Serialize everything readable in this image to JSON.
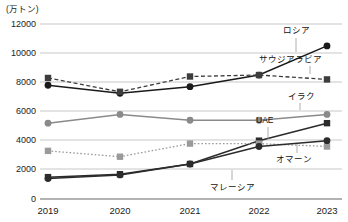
{
  "chart_data": {
    "type": "line",
    "title": "",
    "subtitle": "",
    "xlabel": "",
    "ylabel": "(万トン)",
    "unit_label": "(万トン)",
    "categories": [
      "2019",
      "2020",
      "2021",
      "2022",
      "2023"
    ],
    "x_tick_labels": [
      "2019",
      "2020",
      "2021",
      "2022",
      "2023"
    ],
    "y_tick_labels": [
      "0",
      "2000",
      "4000",
      "6000",
      "8000",
      "10000",
      "12000"
    ],
    "y_ticks": [
      0,
      2000,
      4000,
      6000,
      8000,
      10000,
      12000
    ],
    "ylim": [
      0,
      12000
    ],
    "grid": true,
    "grid_axis": "y",
    "legend": "inline-labels-right",
    "series": [
      {
        "name": "ロシア",
        "label": "ロシア",
        "marker": "circle",
        "line_style": "solid",
        "color": "#1a1a1a",
        "values": [
          7800,
          7250,
          7700,
          8500,
          10500
        ]
      },
      {
        "name": "サウジアラビア",
        "label": "サウジアラビア",
        "marker": "square",
        "line_style": "dashed",
        "color": "#3d3d3d",
        "values": [
          8300,
          7350,
          8400,
          8500,
          8200
        ]
      },
      {
        "name": "イラク",
        "label": "イラク",
        "marker": "circle",
        "line_style": "solid",
        "color": "#8a8a8a",
        "values": [
          5200,
          5800,
          5400,
          5400,
          5800
        ]
      },
      {
        "name": "UAE",
        "label": "UAE",
        "marker": "square",
        "line_style": "solid",
        "color": "#2b2b2b",
        "values": [
          1500,
          1700,
          2400,
          4000,
          5200
        ]
      },
      {
        "name": "オマーン",
        "label": "オマーン",
        "marker": "square",
        "line_style": "dotted",
        "color": "#9a9a9a",
        "values": [
          3300,
          2900,
          3800,
          3800,
          3600
        ]
      },
      {
        "name": "マレーシア",
        "label": "マレーシア",
        "marker": "circle",
        "line_style": "solid",
        "color": "#2b2b2b",
        "values": [
          1400,
          1650,
          2400,
          3600,
          4000
        ]
      }
    ],
    "annotations": [
      {
        "text": "ロシア",
        "points_to_series": "ロシア"
      },
      {
        "text": "サウジアラビア",
        "points_to_series": "サウジアラビア"
      },
      {
        "text": "イラク",
        "points_to_series": "イラク"
      },
      {
        "text": "UAE",
        "points_to_series": "UAE"
      },
      {
        "text": "オマーン",
        "points_to_series": "オマーン"
      },
      {
        "text": "マレーシア",
        "points_to_series": "マレーシア"
      }
    ]
  },
  "labels": {
    "unit": "(万トン)",
    "y0": "0",
    "y2000": "2000",
    "y4000": "4000",
    "y6000": "6000",
    "y8000": "8000",
    "y10000": "10000",
    "y12000": "12000",
    "x2019": "2019",
    "x2020": "2020",
    "x2021": "2021",
    "x2022": "2022",
    "x2023": "2023",
    "s_russia": "ロシア",
    "s_saudi": "サウジアラビア",
    "s_iraq": "イラク",
    "s_uae": "UAE",
    "s_oman": "オマーン",
    "s_malaysia": "マレーシア"
  }
}
